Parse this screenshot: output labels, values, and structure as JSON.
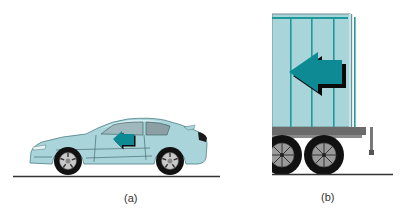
{
  "figure": {
    "panels": [
      {
        "id": "a",
        "label": "(a)",
        "subject": "car",
        "arrow_direction": "left"
      },
      {
        "id": "b",
        "label": "(b)",
        "subject": "truck-trailer",
        "arrow_direction": "left"
      }
    ],
    "colors": {
      "body": "#a8d4da",
      "body_light": "#c4e6ea",
      "rib": "#1e9a9a",
      "arrow": "#0e8a94",
      "arrow_shadow": "#0a0a0a",
      "tire": "#111111",
      "hub": "#9a9a9a",
      "ground": "#333333",
      "undercarriage": "#6b6b6b"
    }
  }
}
